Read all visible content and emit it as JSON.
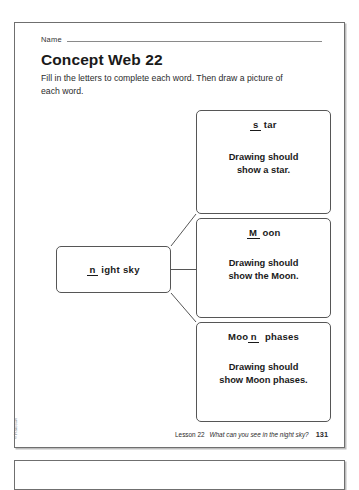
{
  "worksheet": {
    "name_label": "Name",
    "title": "Concept Web 22",
    "instructions": "Fill in the letters to complete each word. Then draw a picture of each word.",
    "copyright": "© Harcourt",
    "footer": {
      "lesson": "Lesson 22",
      "question": "What can you see in the night sky?",
      "page": "131"
    }
  },
  "web": {
    "center": {
      "blank": "n",
      "rest": "ight sky",
      "full_text": "n ight sky"
    },
    "branches": [
      {
        "title_blank": "s",
        "title_before": "",
        "title_after": "tar",
        "title_full": "s tar",
        "body": "Drawing should show a star.",
        "body_line1": "Drawing should",
        "body_line2": "show a star."
      },
      {
        "title_blank": "M",
        "title_before": "",
        "title_after": "oon",
        "title_full": "M oon",
        "body": "Drawing should show the Moon.",
        "body_line1": "Drawing should",
        "body_line2": "show the Moon."
      },
      {
        "title_blank": "n",
        "title_before": "Moo",
        "title_after": "phases",
        "title_full": "Moo n phases",
        "body": "Drawing should show Moon phases.",
        "body_line1": "Drawing should",
        "body_line2": "show Moon phases."
      }
    ]
  },
  "colors": {
    "ink": "#231f20",
    "rule": "#8a8a8a",
    "box_border": "#565656",
    "page_border": "#6f6f6f",
    "paper": "#ffffff"
  }
}
